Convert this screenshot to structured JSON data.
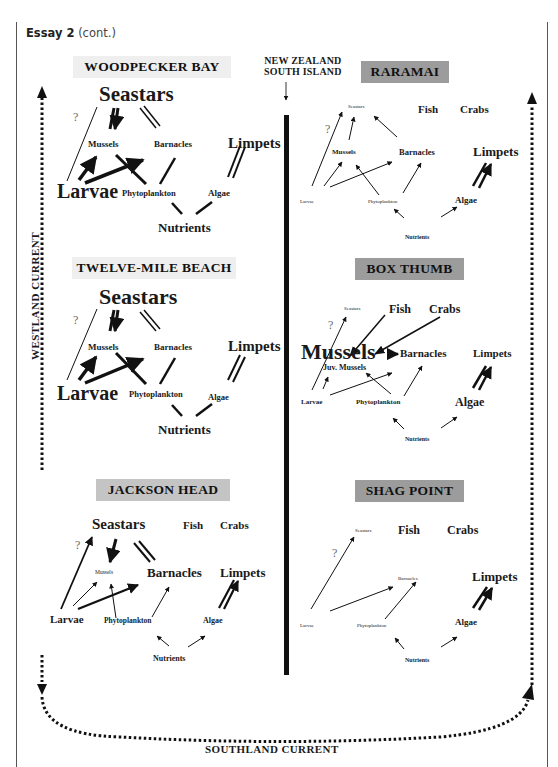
{
  "header": {
    "essay_label": "Essay 2",
    "essay_suffix": "(cont.)"
  },
  "map": {
    "island_label_line1": "NEW ZEALAND",
    "island_label_line2": "SOUTH ISLAND",
    "westland_current": "WESTLAND CURRENT",
    "southland_current": "SOUTHLAND CURRENT"
  },
  "sites": {
    "woodpecker_bay": {
      "title": "WOODPECKER BAY",
      "nodes": {
        "seastars": "Seastars",
        "mussels": "Mussels",
        "barnacles": "Barnacles",
        "limpets": "Limpets",
        "larvae": "Larvae",
        "phytoplankton": "Phytoplankton",
        "algae": "Algae",
        "nutrients": "Nutrients",
        "unknown": "?"
      }
    },
    "twelve_mile_beach": {
      "title": "TWELVE-MILE BEACH",
      "nodes": {
        "seastars": "Seastars",
        "mussels": "Mussels",
        "barnacles": "Barnacles",
        "limpets": "Limpets",
        "larvae": "Larvae",
        "phytoplankton": "Phytoplankton",
        "algae": "Algae",
        "nutrients": "Nutrients",
        "unknown": "?"
      }
    },
    "jackson_head": {
      "title": "JACKSON HEAD",
      "nodes": {
        "seastars": "Seastars",
        "fish": "Fish",
        "crabs": "Crabs",
        "mussels": "Mussels",
        "barnacles": "Barnacles",
        "limpets": "Limpets",
        "larvae": "Larvae",
        "phytoplankton": "Phytoplankton",
        "algae": "Algae",
        "nutrients": "Nutrients",
        "unknown": "?"
      }
    },
    "raramai": {
      "title": "RARAMAI",
      "nodes": {
        "seastars": "Seastars",
        "fish": "Fish",
        "crabs": "Crabs",
        "mussels": "Mussels",
        "barnacles": "Barnacles",
        "limpets": "Limpets",
        "larvae": "Larvae",
        "phytoplankton": "Phytoplankton",
        "algae": "Algae",
        "nutrients": "Nutrients",
        "unknown": "?"
      }
    },
    "box_thumb": {
      "title": "BOX THUMB",
      "nodes": {
        "seastars": "Seastars",
        "fish": "Fish",
        "crabs": "Crabs",
        "mussels": "Mussels",
        "juv_mussels": "Juv. Mussels",
        "barnacles": "Barnacles",
        "limpets": "Limpets",
        "larvae": "Larvae",
        "phytoplankton": "Phytoplankton",
        "algae": "Algae",
        "nutrients": "Nutrients",
        "unknown": "?"
      }
    },
    "shag_point": {
      "title": "SHAG POINT",
      "nodes": {
        "seastars": "Seastars",
        "fish": "Fish",
        "crabs": "Crabs",
        "barnacles": "Barnacles",
        "limpets": "Limpets",
        "larvae": "Larvae",
        "phytoplankton": "Phytoplankton",
        "algae": "Algae",
        "nutrients": "Nutrients",
        "unknown": "?"
      }
    }
  },
  "colors": {
    "label_light": "#efefef",
    "label_mid": "#c4c4c4",
    "label_dark": "#9c9c9c",
    "ink": "#1a1a1a"
  }
}
